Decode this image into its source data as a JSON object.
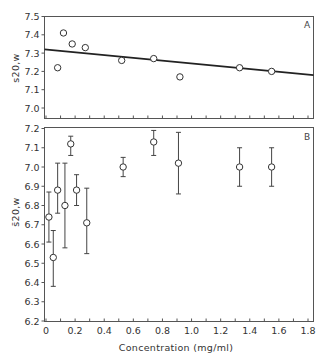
{
  "chart_data": [
    {
      "type": "scatter",
      "panel_label": "A",
      "title": "",
      "xlabel": "",
      "ylabel": "s20,w",
      "xlim": [
        0,
        1.8
      ],
      "ylim": [
        6.95,
        7.5
      ],
      "yticks": [
        7.0,
        7.1,
        7.2,
        7.3,
        7.4,
        7.5
      ],
      "ytick_labels": [
        "7.0",
        "7.1",
        "7.2",
        "7.3",
        "7.4",
        "7.5"
      ],
      "xticks": [
        0,
        0.1,
        0.2,
        0.3,
        0.4,
        0.5,
        0.6,
        0.7,
        0.8,
        0.9,
        1.0,
        1.1,
        1.2,
        1.3,
        1.4,
        1.5,
        1.6,
        1.7,
        1.8
      ],
      "grid": false,
      "points": [
        {
          "x": 0.08,
          "y": 7.22
        },
        {
          "x": 0.12,
          "y": 7.41
        },
        {
          "x": 0.18,
          "y": 7.35
        },
        {
          "x": 0.27,
          "y": 7.33
        },
        {
          "x": 0.52,
          "y": 7.26
        },
        {
          "x": 0.74,
          "y": 7.27
        },
        {
          "x": 0.92,
          "y": 7.17
        },
        {
          "x": 1.33,
          "y": 7.22
        },
        {
          "x": 1.55,
          "y": 7.2
        }
      ],
      "fit_line": {
        "x": [
          0,
          1.8
        ],
        "y": [
          7.32,
          7.18
        ]
      }
    },
    {
      "type": "scatter",
      "panel_label": "B",
      "title": "",
      "xlabel": "Concentration  (mg/ml)",
      "ylabel": "s̄20,w",
      "xlim": [
        0,
        1.8
      ],
      "ylim": [
        6.2,
        7.2
      ],
      "yticks": [
        6.2,
        6.3,
        6.4,
        6.5,
        6.6,
        6.7,
        6.8,
        6.9,
        7.0,
        7.1,
        7.2
      ],
      "ytick_labels": [
        "6.2",
        "6.3",
        "6.4",
        "6.5",
        "6.6",
        "6.7",
        "6.8",
        "6.9",
        "7.0",
        "7.1",
        "7.2"
      ],
      "xticks": [
        0,
        0.2,
        0.4,
        0.6,
        0.8,
        1.0,
        1.2,
        1.4,
        1.6,
        1.8
      ],
      "xtick_labels": [
        "0",
        "0.2",
        "0.4",
        "0.6",
        "0.8",
        "1.0",
        "1.2",
        "1.4",
        "1.6",
        "1.8"
      ],
      "grid": false,
      "points": [
        {
          "x": 0.02,
          "y": 6.74,
          "ylow": 6.61,
          "yhigh": 6.87
        },
        {
          "x": 0.05,
          "y": 6.53,
          "ylow": 6.38,
          "yhigh": 6.67
        },
        {
          "x": 0.08,
          "y": 6.88,
          "ylow": 6.76,
          "yhigh": 7.02
        },
        {
          "x": 0.13,
          "y": 6.8,
          "ylow": 6.58,
          "yhigh": 7.02
        },
        {
          "x": 0.17,
          "y": 7.12,
          "ylow": 7.06,
          "yhigh": 7.16
        },
        {
          "x": 0.21,
          "y": 6.88,
          "ylow": 6.8,
          "yhigh": 6.96
        },
        {
          "x": 0.28,
          "y": 6.71,
          "ylow": 6.55,
          "yhigh": 6.89
        },
        {
          "x": 0.53,
          "y": 7.0,
          "ylow": 6.95,
          "yhigh": 7.05
        },
        {
          "x": 0.74,
          "y": 7.13,
          "ylow": 7.06,
          "yhigh": 7.19
        },
        {
          "x": 0.91,
          "y": 7.02,
          "ylow": 6.86,
          "yhigh": 7.18
        },
        {
          "x": 1.33,
          "y": 7.0,
          "ylow": 6.9,
          "yhigh": 7.1
        },
        {
          "x": 1.55,
          "y": 7.0,
          "ylow": 6.9,
          "yhigh": 7.1
        }
      ]
    }
  ]
}
